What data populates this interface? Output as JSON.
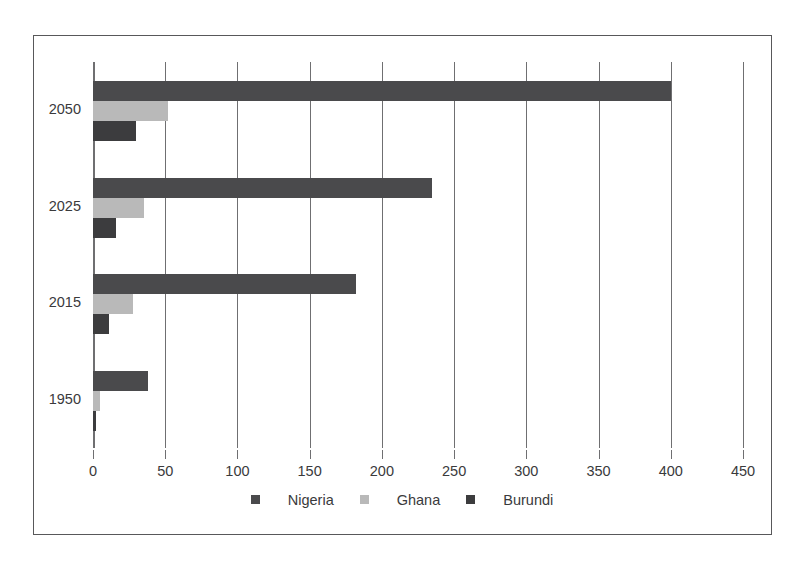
{
  "chart_data": {
    "type": "bar",
    "orientation": "horizontal",
    "title": "",
    "subtitle": "",
    "xlabel": "",
    "ylabel": "",
    "categories": [
      "2050",
      "2025",
      "2015",
      "1950"
    ],
    "series": [
      {
        "name": "Nigeria",
        "color": "#4a4a4c",
        "values": [
          400,
          235,
          182,
          38
        ]
      },
      {
        "name": "Ghana",
        "color": "#b9b9b9",
        "values": [
          52,
          35,
          28,
          5
        ]
      },
      {
        "name": "Burundi",
        "color": "#3c3c3e",
        "values": [
          30,
          16,
          11,
          2
        ]
      }
    ],
    "xlim": [
      0,
      450
    ],
    "xticks": [
      0,
      50,
      100,
      150,
      200,
      250,
      300,
      350,
      400,
      450
    ],
    "xticklabels": [
      "0",
      "50",
      "100",
      "150",
      "200",
      "250",
      "300",
      "350",
      "400",
      "450"
    ],
    "grid": "vertical",
    "legend_position": "bottom",
    "legend_entries": [
      "Nigeria",
      "Ghana",
      "Burundi"
    ],
    "frame_color": "#58585a",
    "gridline_color": "#6f6f71",
    "text_color": "#3a3a3c",
    "background": "#ffffff"
  }
}
